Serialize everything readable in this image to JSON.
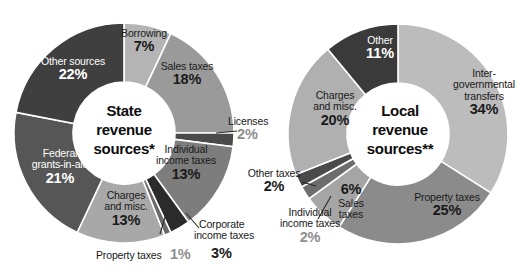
{
  "figure": {
    "background": "#ffffff",
    "charts": [
      {
        "id": "state-revenue",
        "center_title_line1": "State",
        "center_title_line2": "revenue",
        "center_title_line3": "sources*"
      },
      {
        "id": "local-revenue",
        "center_title_line1": "Local",
        "center_title_line2": "revenue",
        "center_title_line3": "sources**"
      }
    ]
  },
  "chart_data": [
    {
      "type": "pie",
      "title": "State revenue sources*",
      "hole": 0.45,
      "start_angle_deg": 0,
      "direction": "clockwise",
      "units": "percent",
      "legend": "none",
      "categories": [
        "Borrowing",
        "Sales taxes",
        "Licenses",
        "Individual income taxes",
        "Corporate income taxes",
        "Property taxes",
        "Charges and misc.",
        "Federal grants-in-aid",
        "Other sources"
      ],
      "values": [
        7,
        18,
        2,
        13,
        3,
        1,
        13,
        21,
        22
      ],
      "colors": [
        "#b4b4b4",
        "#9a9a9a",
        "#4a4a4a",
        "#7d7d7d",
        "#2b2b2b",
        "#6a6a6a",
        "#a8a8a8",
        "#565656",
        "#3f3f3f"
      ],
      "labels": [
        {
          "name": "Borrowing",
          "pct": "7%"
        },
        {
          "name": "Sales taxes",
          "pct": "18%"
        },
        {
          "name": "Licenses",
          "pct": "2%"
        },
        {
          "name": "Individual income taxes",
          "pct": "13%"
        },
        {
          "name": "Corporate income taxes",
          "pct": "3%"
        },
        {
          "name": "Property taxes",
          "pct": "1%"
        },
        {
          "name": "Charges and misc.",
          "pct": "13%"
        },
        {
          "name": "Federal grants-in-aid",
          "pct": "21%"
        },
        {
          "name": "Other sources",
          "pct": "22%"
        }
      ]
    },
    {
      "type": "pie",
      "title": "Local revenue sources**",
      "hole": 0.45,
      "start_angle_deg": 0,
      "direction": "clockwise",
      "units": "percent",
      "legend": "none",
      "categories": [
        "Intergovernmental transfers",
        "Property taxes",
        "Sales taxes",
        "Individual income taxes",
        "Other taxes",
        "Charges and misc.",
        "Other"
      ],
      "values": [
        34,
        25,
        6,
        2,
        2,
        20,
        11
      ],
      "colors": [
        "#bcbcbc",
        "#8b8b8b",
        "#a5a5a5",
        "#6d6d6d",
        "#4a4a4a",
        "#b0b0b0",
        "#3a3a3a"
      ],
      "labels": [
        {
          "name_line1": "Inter-",
          "name_line2": "governmental",
          "name_line3": "transfers",
          "pct": "34%"
        },
        {
          "name": "Property taxes",
          "pct": "25%"
        },
        {
          "name_line1": "Sales",
          "name_line2": "taxes",
          "pct": "6%"
        },
        {
          "name_line1": "Individual",
          "name_line2": "income taxes",
          "pct": "2%"
        },
        {
          "name": "Other taxes",
          "pct": "2%"
        },
        {
          "name_line1": "Charges",
          "name_line2": "and misc.",
          "pct": "20%"
        },
        {
          "name": "Other",
          "pct": "11%"
        }
      ]
    }
  ],
  "left": {
    "center": {
      "l1": "State",
      "l2": "revenue",
      "l3": "sources*"
    },
    "borrowing": {
      "name": "Borrowing",
      "pct": "7%"
    },
    "sales": {
      "name": "Sales taxes",
      "pct": "18%"
    },
    "licenses": {
      "name": "Licenses",
      "pct": "2%"
    },
    "individual": {
      "n1": "Individual",
      "n2": "income taxes",
      "pct": "13%"
    },
    "corporate": {
      "n1": "Corporate",
      "n2": "income taxes",
      "pct": "3%"
    },
    "property": {
      "name": "Property taxes",
      "pct": "1%"
    },
    "charges": {
      "n1": "Charges",
      "n2": "and misc.",
      "pct": "13%"
    },
    "federal": {
      "n1": "Federal",
      "n2": "grants-in-aid",
      "pct": "21%"
    },
    "other": {
      "name": "Other sources",
      "pct": "22%"
    }
  },
  "right": {
    "center": {
      "l1": "Local",
      "l2": "revenue",
      "l3": "sources**"
    },
    "inter": {
      "n1": "Inter-",
      "n2": "governmental",
      "n3": "transfers",
      "pct": "34%"
    },
    "property": {
      "name": "Property taxes",
      "pct": "25%"
    },
    "sales": {
      "n1": "Sales",
      "n2": "taxes",
      "pct": "6%"
    },
    "individual": {
      "n1": "Individual",
      "n2": "income taxes",
      "pct": "2%"
    },
    "othertaxes": {
      "name": "Other taxes",
      "pct": "2%"
    },
    "charges": {
      "n1": "Charges",
      "n2": "and misc.",
      "pct": "20%"
    },
    "other": {
      "name": "Other",
      "pct": "11%"
    }
  }
}
